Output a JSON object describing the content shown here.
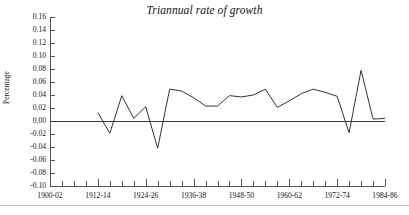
{
  "chart_data": {
    "type": "line",
    "title": "Triannual rate of growth",
    "subtitle": "",
    "xlabel": "",
    "ylabel": "Percentage",
    "ylim": [
      -0.1,
      0.16
    ],
    "ytick_step": 0.02,
    "ytick_labels": [
      "0.16",
      "0.14",
      "0.12",
      "0.10",
      "0.08",
      "0.06",
      "0.04",
      "0.02",
      "0.00",
      "-0.02",
      "-0.04",
      "-0.06",
      "-0.08",
      "-0.10"
    ],
    "ytick_values": [
      0.16,
      0.14,
      0.12,
      0.1,
      0.08,
      0.06,
      0.04,
      0.02,
      0.0,
      -0.02,
      -0.04,
      -0.06,
      -0.08,
      -0.1
    ],
    "xtick_labels": [
      "1900-02",
      "1912-14",
      "1924-26",
      "1936-38",
      "1948-50",
      "1960-62",
      "1972-74",
      "1984-86"
    ],
    "xtick_label_indices": [
      0,
      4,
      8,
      12,
      16,
      20,
      24,
      28
    ],
    "xtick_count": 29,
    "grid": false,
    "legend": false,
    "zero_line": true,
    "line_color": "#333333",
    "axis_color": "#555555",
    "categories": [
      "1900-02",
      "1903-05",
      "1906-08",
      "1909-11",
      "1912-14",
      "1915-17",
      "1918-20",
      "1921-23",
      "1924-26",
      "1927-29",
      "1930-32",
      "1933-35",
      "1936-38",
      "1939-41",
      "1942-44",
      "1945-47",
      "1948-50",
      "1951-53",
      "1954-56",
      "1957-59",
      "1960-62",
      "1963-65",
      "1966-68",
      "1969-71",
      "1972-74",
      "1975-77",
      "1978-80",
      "1981-83",
      "1984-86"
    ],
    "series": [
      {
        "name": "Triannual rate of growth",
        "values": [
          null,
          null,
          null,
          null,
          0.013,
          -0.019,
          0.039,
          0.004,
          0.022,
          -0.042,
          0.049,
          0.046,
          0.036,
          0.023,
          0.023,
          0.039,
          0.037,
          0.04,
          0.049,
          0.021,
          0.031,
          0.042,
          0.049,
          0.044,
          0.038,
          -0.018,
          0.078,
          0.003,
          0.004
        ]
      }
    ],
    "annotations": []
  },
  "figure": {
    "footer_rule_visible": true
  }
}
